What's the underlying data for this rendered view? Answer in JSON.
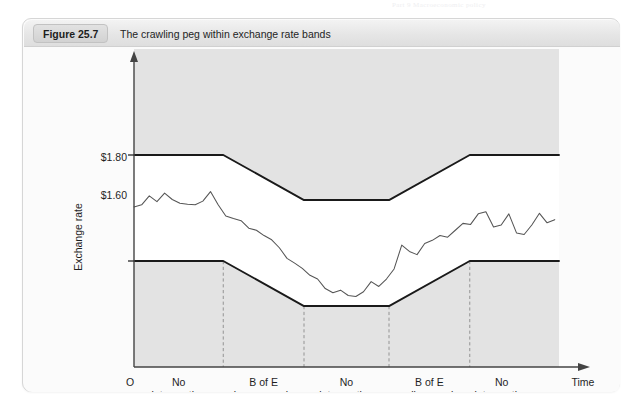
{
  "page": {
    "ghost_header": "Part 9  Macroeconomic policy"
  },
  "figure": {
    "number_label": "Figure 25.7",
    "caption": "The crawling peg within exchange rate bands"
  },
  "chart_data": {
    "type": "line",
    "title": "The crawling peg within exchange rate bands",
    "xlabel": "Time",
    "ylabel": "Exchange rate",
    "origin_label": "O",
    "grid": false,
    "legend": null,
    "y_ticks": [
      "$1.80",
      "$1.60"
    ],
    "y_tick_values": [
      1.8,
      1.6
    ],
    "ylim": [
      1.4,
      2.0
    ],
    "xlim": [
      0,
      100
    ],
    "axis_arrows": [
      "y-up",
      "x-right"
    ],
    "phase_labels": [
      {
        "line1": "No",
        "line2": "intervention"
      },
      {
        "line1": "B of E",
        "line2": "buys pounds"
      },
      {
        "line1": "No",
        "line2": "intervention"
      },
      {
        "line1": "B of E",
        "line2": "sells pounds"
      },
      {
        "line1": "No",
        "line2": "intervention"
      }
    ],
    "phase_boundaries_x": [
      21,
      40,
      60,
      79
    ],
    "series": [
      {
        "name": "Upper band (ceiling)",
        "style": "solid-thick",
        "x": [
          0,
          21,
          40,
          60,
          79,
          100
        ],
        "values": [
          1.8,
          1.8,
          1.715,
          1.715,
          1.8,
          1.8
        ]
      },
      {
        "name": "Lower band (floor)",
        "style": "solid-thick",
        "x": [
          0,
          21,
          40,
          60,
          79,
          100
        ],
        "values": [
          1.6,
          1.6,
          1.515,
          1.515,
          1.6,
          1.6
        ]
      },
      {
        "name": "Market exchange rate",
        "style": "solid-thin-wiggly",
        "x": [
          0,
          1.8,
          3.6,
          5.4,
          7.2,
          9,
          10.8,
          12.6,
          14.4,
          16.2,
          18,
          19.8,
          21.6,
          23.4,
          25.2,
          27,
          28.8,
          30.6,
          32.4,
          34.2,
          36,
          37.8,
          39.6,
          41.4,
          43.2,
          45,
          46.8,
          48.6,
          50.4,
          52.2,
          54,
          55.8,
          57.6,
          59.4,
          61.2,
          63,
          64.8,
          66.6,
          68.4,
          70.2,
          72,
          73.8,
          75.6,
          77.4,
          79.2,
          81,
          82.8,
          84.6,
          86.4,
          88.2,
          90,
          91.8,
          93.6,
          95.4,
          97.2,
          99
        ],
        "values": [
          1.702,
          1.706,
          1.723,
          1.712,
          1.728,
          1.716,
          1.709,
          1.707,
          1.706,
          1.713,
          1.731,
          1.706,
          1.685,
          1.68,
          1.676,
          1.662,
          1.658,
          1.648,
          1.64,
          1.625,
          1.605,
          1.596,
          1.586,
          1.573,
          1.566,
          1.548,
          1.54,
          1.545,
          1.535,
          1.533,
          1.542,
          1.561,
          1.552,
          1.566,
          1.585,
          1.63,
          1.618,
          1.612,
          1.633,
          1.639,
          1.648,
          1.645,
          1.658,
          1.671,
          1.669,
          1.689,
          1.693,
          1.664,
          1.668,
          1.689,
          1.653,
          1.65,
          1.668,
          1.69,
          1.672,
          1.678
        ]
      }
    ],
    "colors": {
      "plot_shade": "#e3e3e3",
      "band_interior": "#ffffff",
      "band_line": "#1a1a1a",
      "rate_line": "#555555",
      "axis": "#444444",
      "divider": "#8a8a8a"
    }
  }
}
